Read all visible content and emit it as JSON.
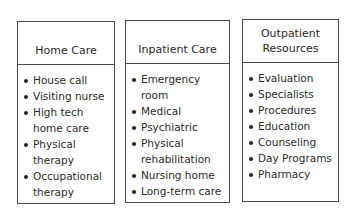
{
  "columns": [
    {
      "title": "Home Care",
      "items": [
        "House call",
        "Visiting nurse",
        "High tech\nhome care",
        "Physical\ntherapy",
        "Occupational\ntherapy"
      ]
    },
    {
      "title": "Inpatient Care",
      "items": [
        "Emergency\nroom",
        "Medical",
        "Psychiatric",
        "Physical\nrehabilitation",
        "Nursing home",
        "Long-term care"
      ]
    },
    {
      "title": "Outpatient\nResources",
      "items": [
        "Evaluation",
        "Specialists",
        "Procedures",
        "Education",
        "Counseling",
        "Day Programs",
        "Pharmacy"
      ]
    }
  ]
}
